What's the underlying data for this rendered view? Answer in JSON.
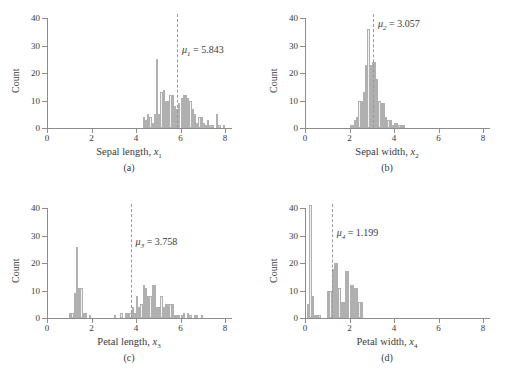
{
  "figure": {
    "axis_color": "#8d8d8d",
    "bar_fill": "#f2f2f2",
    "bar_stroke": "#b0b0b0",
    "mean_line_color": "#9a9a9a",
    "ylabel": "Count",
    "yticks": [
      "0",
      "10",
      "20",
      "30",
      "40"
    ],
    "ylim": [
      0,
      40
    ],
    "xticks": [
      "0",
      "2",
      "4",
      "6",
      "8"
    ],
    "xlim": [
      0,
      8
    ]
  },
  "chart_data": [
    {
      "type": "bar",
      "panel": "(a)",
      "title": "",
      "xlabel_text": "Sepal length, ",
      "xlabel_var": "x",
      "xlabel_sub": "1",
      "ylabel": "Count",
      "xlim": [
        0,
        8
      ],
      "ylim": [
        0,
        40
      ],
      "xticks": [
        0,
        2,
        4,
        6,
        8
      ],
      "yticks": [
        0,
        10,
        20,
        30,
        40
      ],
      "grid": false,
      "bin_width": 0.1,
      "mean_symbol": "μ",
      "mean_sub": "1",
      "mean_value": 5.843,
      "mean_label": "= 5.843",
      "bins": [
        4.3,
        4.4,
        4.5,
        4.6,
        4.7,
        4.8,
        4.9,
        5.0,
        5.1,
        5.2,
        5.3,
        5.4,
        5.5,
        5.6,
        5.7,
        5.8,
        5.9,
        6.0,
        6.1,
        6.2,
        6.3,
        6.4,
        6.5,
        6.6,
        6.7,
        6.8,
        6.9,
        7.0,
        7.1,
        7.2,
        7.3,
        7.4,
        7.6,
        7.7,
        7.9
      ],
      "counts": [
        4,
        3,
        5,
        4,
        2,
        5,
        25,
        5,
        13,
        14,
        10,
        10,
        12,
        12,
        8,
        7,
        9,
        11,
        12,
        12,
        11,
        10,
        7,
        5,
        2,
        4,
        4,
        2,
        1,
        3,
        1,
        1,
        5,
        1,
        1
      ]
    },
    {
      "type": "bar",
      "panel": "(b)",
      "title": "",
      "xlabel_text": "Sepal width, ",
      "xlabel_var": "x",
      "xlabel_sub": "2",
      "ylabel": "Count",
      "xlim": [
        0,
        8
      ],
      "ylim": [
        0,
        40
      ],
      "xticks": [
        0,
        2,
        4,
        6,
        8
      ],
      "yticks": [
        0,
        10,
        20,
        30,
        40
      ],
      "grid": false,
      "bin_width": 0.1,
      "mean_symbol": "μ",
      "mean_sub": "2",
      "mean_value": 3.057,
      "mean_label": "= 3.057",
      "bins": [
        2.0,
        2.1,
        2.2,
        2.3,
        2.4,
        2.5,
        2.6,
        2.7,
        2.8,
        2.9,
        3.0,
        3.1,
        3.2,
        3.3,
        3.4,
        3.5,
        3.6,
        3.7,
        3.8,
        3.9,
        4.0,
        4.1,
        4.2,
        4.3,
        4.4
      ],
      "counts": [
        1,
        1,
        3,
        4,
        10,
        10,
        13,
        23,
        36,
        23,
        24,
        24,
        18,
        10,
        9,
        9,
        4,
        3,
        3,
        1,
        2,
        2,
        1,
        1,
        1
      ]
    },
    {
      "type": "bar",
      "panel": "(c)",
      "title": "",
      "xlabel_text": "Petal length, ",
      "xlabel_var": "x",
      "xlabel_sub": "3",
      "ylabel": "Count",
      "xlim": [
        0,
        8
      ],
      "ylim": [
        0,
        40
      ],
      "xticks": [
        0,
        2,
        4,
        6,
        8
      ],
      "yticks": [
        0,
        10,
        20,
        30,
        40
      ],
      "grid": false,
      "bin_width": 0.1,
      "mean_symbol": "μ",
      "mean_sub": "3",
      "mean_value": 3.758,
      "mean_label": "= 3.758",
      "bins": [
        1.0,
        1.1,
        1.2,
        1.3,
        1.4,
        1.5,
        1.6,
        1.7,
        1.9,
        3.0,
        3.3,
        3.5,
        3.6,
        3.7,
        3.8,
        3.9,
        4.0,
        4.1,
        4.2,
        4.3,
        4.4,
        4.5,
        4.6,
        4.7,
        4.8,
        4.9,
        5.0,
        5.1,
        5.2,
        5.3,
        5.4,
        5.5,
        5.6,
        5.7,
        5.8,
        5.9,
        6.0,
        6.1,
        6.3,
        6.4,
        6.6,
        6.7,
        6.9
      ],
      "counts": [
        2,
        2,
        9,
        26,
        11,
        11,
        2,
        2,
        1,
        1,
        2,
        2,
        2,
        2,
        4,
        2,
        8,
        4,
        5,
        12,
        11,
        8,
        8,
        12,
        12,
        4,
        4,
        8,
        4,
        5,
        5,
        5,
        5,
        1,
        1,
        1,
        1,
        2,
        2,
        1,
        1,
        1,
        1
      ]
    },
    {
      "type": "bar",
      "panel": "(d)",
      "title": "",
      "xlabel_text": "Petal width, ",
      "xlabel_var": "x",
      "xlabel_sub": "4",
      "ylabel": "Count",
      "xlim": [
        0,
        8
      ],
      "ylim": [
        0,
        40
      ],
      "xticks": [
        0,
        2,
        4,
        6,
        8
      ],
      "yticks": [
        0,
        10,
        20,
        30,
        40
      ],
      "grid": false,
      "bin_width": 0.1,
      "mean_symbol": "μ",
      "mean_sub": "4",
      "mean_value": 1.199,
      "mean_label": "= 1.199",
      "bins": [
        0.1,
        0.2,
        0.3,
        0.4,
        0.5,
        0.6,
        1.0,
        1.1,
        1.2,
        1.3,
        1.4,
        1.5,
        1.6,
        1.7,
        1.8,
        1.9,
        2.0,
        2.1,
        2.2,
        2.3,
        2.4,
        2.5
      ],
      "counts": [
        5,
        41,
        8,
        1,
        1,
        1,
        10,
        10,
        18,
        20,
        20,
        11,
        6,
        6,
        17,
        17,
        12,
        12,
        11,
        11,
        6,
        6
      ]
    }
  ]
}
